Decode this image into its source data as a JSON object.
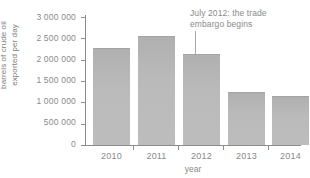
{
  "chart_data": {
    "type": "bar",
    "title": "",
    "categories": [
      "2010",
      "2011",
      "2012",
      "2013",
      "2014"
    ],
    "values": [
      2270000,
      2560000,
      2130000,
      1250000,
      1150000
    ],
    "xlabel": "year",
    "ylabel": "barrels of crude oil exported per day",
    "ylabel_lines": [
      "barrels of crude oil",
      "exported per day"
    ],
    "ylim": [
      0,
      3000000
    ],
    "ytick_values": [
      0,
      500000,
      1000000,
      1500000,
      2000000,
      2500000,
      3000000
    ],
    "ytick_labels": [
      "0",
      "500 000",
      "1 000 000",
      "1 500 000",
      "2 000 000",
      "2 500 000",
      "3 000 000"
    ],
    "grid": false,
    "legend": null,
    "bar_color": "#bababa",
    "axis_color": "#8c8c8c",
    "text_color": "#8a8a8a",
    "annotations": [
      {
        "text_lines": [
          "July 2012: the trade",
          "embargo begins"
        ],
        "text": "July 2012: the trade embargo begins",
        "points_to_category": "2012"
      }
    ]
  }
}
